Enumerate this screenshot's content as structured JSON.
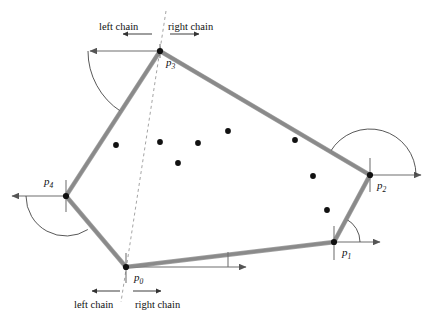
{
  "figure": {
    "background": "#ffffff",
    "width": 433,
    "height": 317,
    "edge_color": "#8a8a8a",
    "edge_outline_color": "#555555",
    "dot_color": "#111111",
    "ray_color": "#6f6f6f",
    "arc_color": "#3a3a3a",
    "dash_color": "#9a9a9a"
  },
  "vertices": [
    {
      "id": "p0",
      "label": "p",
      "sub": "0",
      "x": 126,
      "y": 267,
      "label_x": 134,
      "label_y": 272
    },
    {
      "id": "p1",
      "label": "p",
      "sub": "1",
      "x": 334,
      "y": 242,
      "label_x": 342,
      "label_y": 247
    },
    {
      "id": "p2",
      "label": "p",
      "sub": "2",
      "x": 370,
      "y": 175,
      "label_x": 377,
      "label_y": 180
    },
    {
      "id": "p3",
      "label": "p",
      "sub": "3",
      "x": 160,
      "y": 51,
      "label_x": 166,
      "label_y": 57
    },
    {
      "id": "p4",
      "label": "p",
      "sub": "4",
      "x": 66,
      "y": 196,
      "label_x": 44,
      "label_y": 176
    }
  ],
  "hull_polygon": [
    {
      "x": 126,
      "y": 267
    },
    {
      "x": 334,
      "y": 242
    },
    {
      "x": 370,
      "y": 175
    },
    {
      "x": 160,
      "y": 51
    },
    {
      "x": 66,
      "y": 196
    }
  ],
  "interior_points": [
    {
      "x": 116,
      "y": 145
    },
    {
      "x": 160,
      "y": 142
    },
    {
      "x": 198,
      "y": 143
    },
    {
      "x": 178,
      "y": 163
    },
    {
      "x": 228,
      "y": 131
    },
    {
      "x": 295,
      "y": 140
    },
    {
      "x": 313,
      "y": 176
    },
    {
      "x": 327,
      "y": 210
    }
  ],
  "dashed_line": {
    "x1": 166,
    "y1": 11,
    "x2": 121,
    "y2": 302,
    "dash": "3 3"
  },
  "labels": {
    "top": {
      "left_chain": "left chain",
      "right_chain": "right chain",
      "left_x": 99,
      "left_y": 22,
      "right_x": 168,
      "right_y": 22,
      "left_arrow": {
        "x1": 152,
        "y1": 34,
        "x2": 123,
        "y2": 34
      },
      "right_arrow": {
        "x1": 170,
        "y1": 34,
        "x2": 199,
        "y2": 34
      }
    },
    "bottom": {
      "left_chain": "left chain",
      "right_chain": "right chain",
      "left_x": 74,
      "left_y": 300,
      "right_x": 135,
      "right_y": 300,
      "left_arrow": {
        "x1": 120,
        "y1": 291,
        "x2": 92,
        "y2": 291
      },
      "right_arrow": {
        "x1": 133,
        "y1": 291,
        "x2": 161,
        "y2": 291
      }
    }
  },
  "rays": [
    {
      "from": "p3",
      "x1": 160,
      "y1": 51,
      "x2": 90,
      "y2": 51,
      "arrow": "left"
    },
    {
      "from": "p4",
      "x1": 66,
      "y1": 196,
      "x2": 12,
      "y2": 196,
      "arrow": "left"
    },
    {
      "from": "p2",
      "x1": 370,
      "y1": 175,
      "x2": 421,
      "y2": 175,
      "arrow": "right"
    },
    {
      "from": "p1",
      "x1": 334,
      "y1": 242,
      "x2": 380,
      "y2": 242,
      "arrow": "right"
    },
    {
      "from": "p0",
      "x1": 126,
      "y1": 267,
      "x2": 246,
      "y2": 267,
      "arrow": "right"
    }
  ],
  "tick_marks": [
    {
      "vertex": "p0",
      "x": 126,
      "y1": 253,
      "y2": 283
    },
    {
      "vertex": "p1",
      "x": 334,
      "y1": 226,
      "y2": 260
    },
    {
      "vertex": "p2",
      "x": 370,
      "y1": 158,
      "y2": 192
    },
    {
      "vertex": "p3",
      "x": 160,
      "y1": 44,
      "y2": 58
    },
    {
      "vertex": "p4",
      "x": 66,
      "y1": 180,
      "y2": 212
    },
    {
      "vertex": "p0-angle",
      "x": 228,
      "y1": 252,
      "y2": 267
    }
  ],
  "angle_arcs": [
    {
      "vertex": "p3",
      "cx": 160,
      "cy": 51,
      "r": 72,
      "start_deg": 180,
      "end_deg": 237
    },
    {
      "vertex": "p4",
      "cx": 66,
      "cy": 196,
      "r": 40,
      "start_deg": 180,
      "end_deg": 303
    },
    {
      "vertex": "p2",
      "cx": 370,
      "cy": 175,
      "r": 46,
      "start_deg": 0,
      "end_deg": 149
    },
    {
      "vertex": "p1",
      "cx": 334,
      "cy": 242,
      "r": 26,
      "start_deg": 0,
      "end_deg": 62
    }
  ]
}
